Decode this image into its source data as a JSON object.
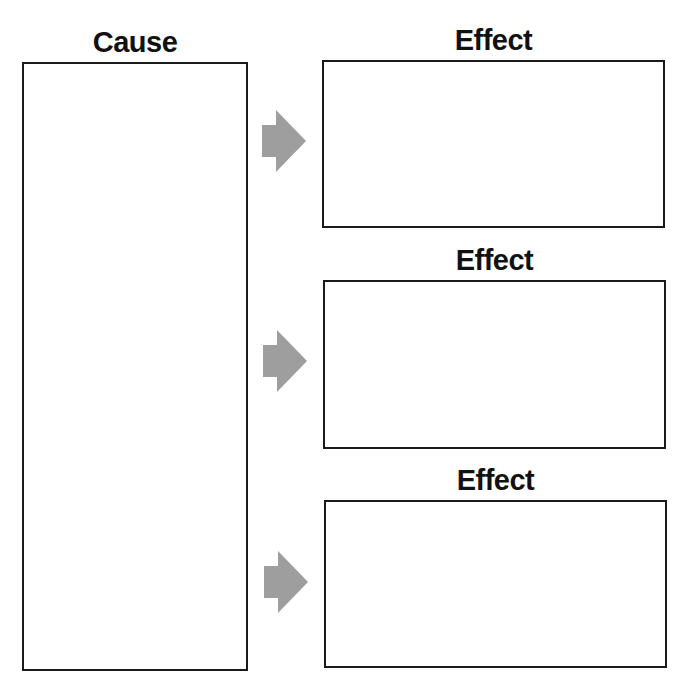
{
  "cause": {
    "label": "Cause"
  },
  "effects": [
    {
      "label": "Effect"
    },
    {
      "label": "Effect"
    },
    {
      "label": "Effect"
    }
  ],
  "colors": {
    "arrow": "#9e9e9e",
    "border": "#1a1a1a"
  }
}
